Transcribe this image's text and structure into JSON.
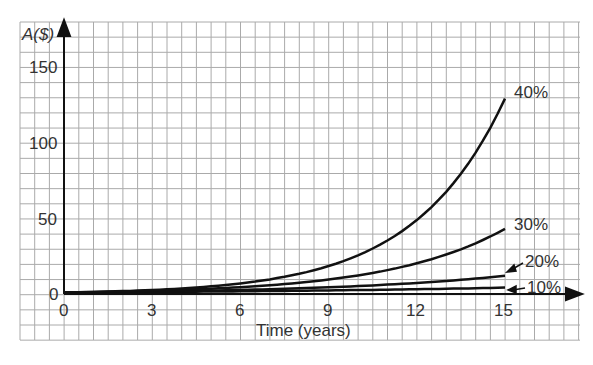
{
  "chart_data": {
    "type": "line",
    "title": "",
    "xlabel": "Time (years)",
    "ylabel": "A($)",
    "xlim": [
      0,
      15
    ],
    "ylim": [
      0,
      150
    ],
    "x_ticks": [
      "0",
      "3",
      "6",
      "9",
      "12",
      "15"
    ],
    "y_ticks": [
      "0",
      "50",
      "100",
      "150"
    ],
    "grid": true,
    "principal": 1,
    "series": [
      {
        "name": "10%",
        "x": [
          0,
          3,
          6,
          9,
          12,
          15
        ],
        "values": [
          1,
          1.3,
          1.8,
          2.4,
          3.1,
          4.2
        ]
      },
      {
        "name": "20%",
        "x": [
          0,
          3,
          6,
          9,
          12,
          15
        ],
        "values": [
          1,
          1.7,
          3.0,
          5.2,
          8.9,
          15.4
        ]
      },
      {
        "name": "30%",
        "x": [
          0,
          3,
          6,
          9,
          12,
          15
        ],
        "values": [
          1,
          2.2,
          4.8,
          10.6,
          23.3,
          51.2
        ]
      },
      {
        "name": "40%",
        "x": [
          0,
          3,
          6,
          9,
          12,
          15
        ],
        "values": [
          1,
          2.7,
          7.5,
          20.7,
          56.7,
          155.6
        ]
      }
    ]
  },
  "labels": {
    "y_axis": "A($)",
    "x_axis": "Time (years)",
    "y150": "150",
    "y100": "100",
    "y50": "50",
    "y0": "0",
    "x0": "0",
    "x3": "3",
    "x6": "6",
    "x9": "9",
    "x12": "12",
    "x15": "15",
    "s40": "40%",
    "s30": "30%",
    "s20": "20%",
    "s10": "10%"
  }
}
